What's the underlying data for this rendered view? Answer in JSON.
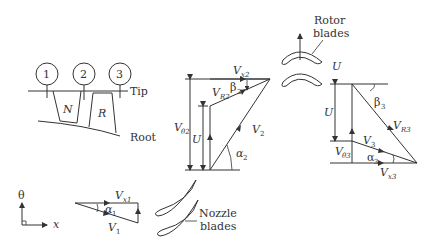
{
  "stations": {
    "s1": "1",
    "s2": "2",
    "s3": "3"
  },
  "passage": {
    "nozzle": "N",
    "rotor": "R",
    "tip": "Tip",
    "root": "Root"
  },
  "axes": {
    "theta": "θ",
    "x": "x"
  },
  "inlet_triangle": {
    "V": "V",
    "V_sub": "1",
    "Vx": "V",
    "Vx_sub": "x1",
    "alpha": "α",
    "alpha_sub": "1"
  },
  "exit_nozzle_triangle": {
    "Vx": "V",
    "Vx_sub": "x2",
    "VR": "V",
    "VR_sub": "R2",
    "beta": "β",
    "beta_sub": "2",
    "Vtheta": "V",
    "Vtheta_sub": "θ2",
    "U": "U",
    "V": "V",
    "V_sub": "2",
    "alpha": "α",
    "alpha_sub": "2"
  },
  "rotor_exit_triangle": {
    "U": "U",
    "U_top": "U",
    "beta": "β",
    "beta_sub": "3",
    "VR": "V",
    "VR_sub": "R3",
    "V": "V",
    "V_sub": "3",
    "Vtheta": "V",
    "Vtheta_sub": "θ3",
    "alpha": "α",
    "alpha_sub": "3",
    "Vx": "V",
    "Vx_sub": "x3"
  },
  "labels": {
    "rotor_line1": "Rotor",
    "rotor_line2": "blades",
    "nozzle_line1": "Nozzle",
    "nozzle_line2": "blades"
  }
}
